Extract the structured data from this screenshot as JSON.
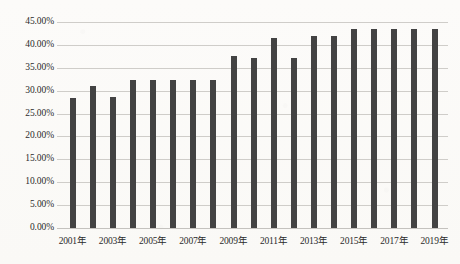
{
  "chart_data": {
    "type": "bar",
    "title": "",
    "xlabel": "",
    "ylabel": "",
    "ylim": [
      0,
      45
    ],
    "grid": true,
    "legend": false,
    "legend_position": "none",
    "bar_color": "#434343",
    "gridline_color": "#cfcdc9",
    "background_color": "#fbfaf8",
    "ytick_labels": [
      "45.00%",
      "40.00%",
      "35.00%",
      "30.00%",
      "25.00%",
      "20.00%",
      "15.00%",
      "10.00%",
      "5.00%",
      "0.00%"
    ],
    "ytick_values": [
      45,
      40,
      35,
      30,
      25,
      20,
      15,
      10,
      5,
      0
    ],
    "categories": [
      "2001年",
      "2002年",
      "2003年",
      "2004年",
      "2005年",
      "2006年",
      "2007年",
      "2008年",
      "2009年",
      "2010年",
      "2011年",
      "2012年",
      "2013年",
      "2014年",
      "2015年",
      "2016年",
      "2017年",
      "2018年",
      "2019年"
    ],
    "xtick_labels_shown": [
      "2001年",
      "2003年",
      "2005年",
      "2007年",
      "2009年",
      "2011年",
      "2013年",
      "2015年",
      "2017年",
      "2019年"
    ],
    "values": [
      28.5,
      31.0,
      28.7,
      32.3,
      32.3,
      32.3,
      32.3,
      32.4,
      37.5,
      37.2,
      41.5,
      37.2,
      42.0,
      41.9,
      43.5,
      43.5,
      43.4,
      43.4,
      43.5
    ],
    "series": [
      {
        "name": "",
        "values": [
          28.5,
          31.0,
          28.7,
          32.3,
          32.3,
          32.3,
          32.3,
          32.4,
          37.5,
          37.2,
          41.5,
          37.2,
          42.0,
          41.9,
          43.5,
          43.5,
          43.4,
          43.4,
          43.5
        ]
      }
    ]
  }
}
